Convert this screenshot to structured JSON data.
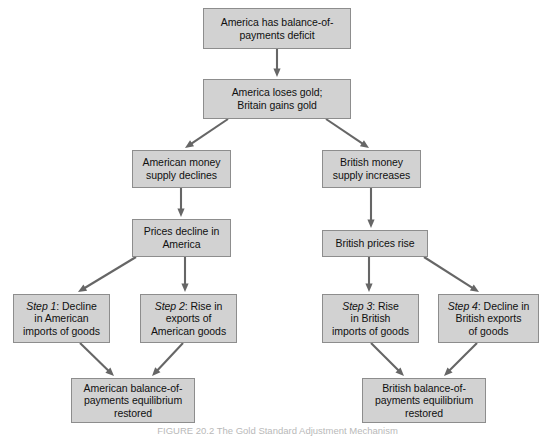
{
  "figure": {
    "caption": "FIGURE 20.2 The Gold Standard Adjustment Mechanism",
    "box_fill_color": "#d2d2d2",
    "box_border_color": "#8d8d8d",
    "arrow_color": "#666666",
    "background_color": "#ffffff",
    "text_color": "#101010"
  },
  "nodes": [
    {
      "id": "deficit",
      "name": "america-deficit-box",
      "lines": [
        "America has balance-of-",
        "payments deficit"
      ],
      "x": 203,
      "y": 8,
      "w": 148,
      "h": 41
    },
    {
      "id": "gold",
      "name": "gold-flow-box",
      "lines": [
        "America loses gold;",
        "Britain gains gold"
      ],
      "x": 203,
      "y": 79,
      "w": 148,
      "h": 40
    },
    {
      "id": "us-money",
      "name": "american-money-supply-box",
      "lines": [
        "American money",
        "supply declines"
      ],
      "x": 132,
      "y": 150,
      "w": 99,
      "h": 38
    },
    {
      "id": "uk-money",
      "name": "british-money-supply-box",
      "lines": [
        "British money",
        "supply increases"
      ],
      "x": 322,
      "y": 150,
      "w": 99,
      "h": 38
    },
    {
      "id": "us-prices",
      "name": "american-prices-decline-box",
      "lines": [
        "Prices decline in",
        "America"
      ],
      "x": 132,
      "y": 219,
      "w": 99,
      "h": 38
    },
    {
      "id": "uk-prices",
      "name": "british-prices-rise-box",
      "lines": [
        "British prices rise"
      ],
      "x": 322,
      "y": 230,
      "w": 106,
      "h": 27
    },
    {
      "id": "step1",
      "name": "step-1-box",
      "step_label": "Step 1",
      "lines": [
        "Step 1: Decline",
        "in American",
        "imports of goods"
      ],
      "x": 13,
      "y": 294,
      "w": 97,
      "h": 49
    },
    {
      "id": "step2",
      "name": "step-2-box",
      "step_label": "Step 2",
      "lines": [
        "Step 2: Rise in",
        "exports of",
        "American goods"
      ],
      "x": 140,
      "y": 294,
      "w": 97,
      "h": 49
    },
    {
      "id": "step3",
      "name": "step-3-box",
      "step_label": "Step 3",
      "lines": [
        "Step 3: Rise",
        "in British",
        "imports of goods"
      ],
      "x": 322,
      "y": 294,
      "w": 97,
      "h": 49
    },
    {
      "id": "step4",
      "name": "step-4-box",
      "step_label": "Step 4",
      "lines": [
        "Step 4: Decline in",
        "British exports",
        "of goods"
      ],
      "x": 438,
      "y": 294,
      "w": 101,
      "h": 49
    },
    {
      "id": "us-equil",
      "name": "american-equilibrium-box",
      "lines": [
        "American balance-of-",
        "payments equilibrium",
        "restored"
      ],
      "x": 71,
      "y": 378,
      "w": 124,
      "h": 45
    },
    {
      "id": "uk-equil",
      "name": "british-equilibrium-box",
      "lines": [
        "British balance-of-",
        "payments equilibrium",
        "restored"
      ],
      "x": 362,
      "y": 378,
      "w": 124,
      "h": 45
    }
  ],
  "arrows": [
    {
      "name": "arrow-deficit-to-gold",
      "from": "deficit",
      "to": "gold",
      "x1": 277,
      "y1": 49,
      "x2": 277,
      "y2": 77
    },
    {
      "name": "arrow-gold-to-us-money",
      "from": "gold",
      "to": "us-money",
      "x1": 228,
      "y1": 119,
      "x2": 185,
      "y2": 148
    },
    {
      "name": "arrow-gold-to-uk-money",
      "from": "gold",
      "to": "uk-money",
      "x1": 326,
      "y1": 119,
      "x2": 369,
      "y2": 148
    },
    {
      "name": "arrow-us-money-to-us-prices",
      "from": "us-money",
      "to": "us-prices",
      "x1": 181,
      "y1": 188,
      "x2": 181,
      "y2": 217
    },
    {
      "name": "arrow-uk-money-to-uk-prices",
      "from": "uk-money",
      "to": "uk-prices",
      "x1": 371,
      "y1": 188,
      "x2": 371,
      "y2": 228
    },
    {
      "name": "arrow-us-prices-to-step1",
      "from": "us-prices",
      "to": "step1",
      "x1": 136,
      "y1": 257,
      "x2": 78,
      "y2": 292
    },
    {
      "name": "arrow-us-prices-to-step2",
      "from": "us-prices",
      "to": "step2",
      "x1": 185,
      "y1": 257,
      "x2": 185,
      "y2": 292
    },
    {
      "name": "arrow-uk-prices-to-step3",
      "from": "uk-prices",
      "to": "step3",
      "x1": 369,
      "y1": 257,
      "x2": 369,
      "y2": 292
    },
    {
      "name": "arrow-uk-prices-to-step4",
      "from": "uk-prices",
      "to": "step4",
      "x1": 424,
      "y1": 257,
      "x2": 479,
      "y2": 292
    },
    {
      "name": "arrow-step1-to-us-equil",
      "from": "step1",
      "to": "us-equil",
      "x1": 80,
      "y1": 343,
      "x2": 114,
      "y2": 376
    },
    {
      "name": "arrow-step2-to-us-equil",
      "from": "step2",
      "to": "us-equil",
      "x1": 183,
      "y1": 343,
      "x2": 152,
      "y2": 376
    },
    {
      "name": "arrow-step3-to-uk-equil",
      "from": "step3",
      "to": "uk-equil",
      "x1": 371,
      "y1": 343,
      "x2": 404,
      "y2": 376
    },
    {
      "name": "arrow-step4-to-uk-equil",
      "from": "step4",
      "to": "uk-equil",
      "x1": 477,
      "y1": 343,
      "x2": 444,
      "y2": 376
    }
  ],
  "chart_data": {
    "type": "diagram",
    "title": "The Gold Standard Adjustment Mechanism",
    "flow": [
      {
        "step": 0,
        "text": "America has balance-of-payments deficit"
      },
      {
        "step": 1,
        "text": "America loses gold; Britain gains gold"
      },
      {
        "step": 2,
        "branch": "america",
        "text": "American money supply declines"
      },
      {
        "step": 2,
        "branch": "britain",
        "text": "British money supply increases"
      },
      {
        "step": 3,
        "branch": "america",
        "text": "Prices decline in America"
      },
      {
        "step": 3,
        "branch": "britain",
        "text": "British prices rise"
      },
      {
        "step": 4,
        "branch": "america",
        "text": "Step 1: Decline in American imports of goods"
      },
      {
        "step": 4,
        "branch": "america",
        "text": "Step 2: Rise in exports of American goods"
      },
      {
        "step": 4,
        "branch": "britain",
        "text": "Step 3: Rise in British imports of goods"
      },
      {
        "step": 4,
        "branch": "britain",
        "text": "Step 4: Decline in British exports of goods"
      },
      {
        "step": 5,
        "branch": "america",
        "text": "American balance-of-payments equilibrium restored"
      },
      {
        "step": 5,
        "branch": "britain",
        "text": "British balance-of-payments equilibrium restored"
      }
    ]
  }
}
